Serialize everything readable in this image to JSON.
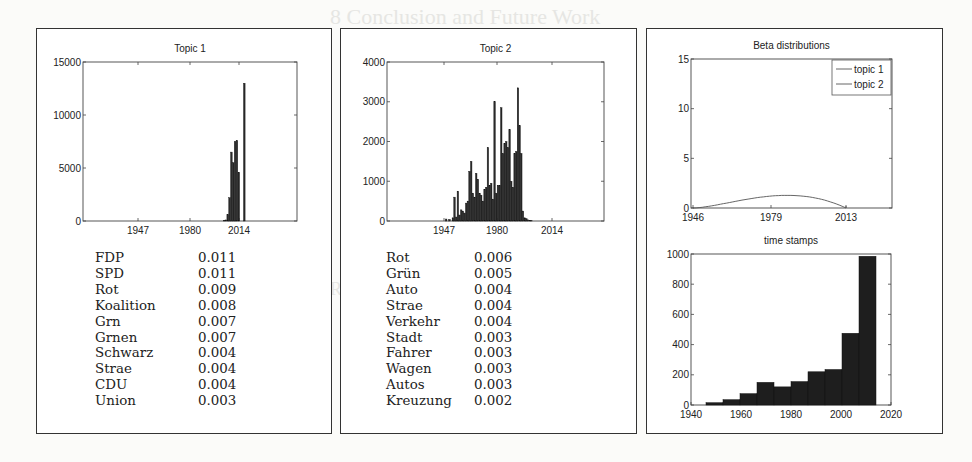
{
  "background_bleed": [
    "8   Conclusion and Future Work",
    "...",
    "References"
  ],
  "panels": [
    {
      "title": "Topic 1",
      "words": [
        {
          "word": "FDP",
          "prob": "0.011"
        },
        {
          "word": "SPD",
          "prob": "0.011"
        },
        {
          "word": "Rot",
          "prob": "0.009"
        },
        {
          "word": "Koalition",
          "prob": "0.008"
        },
        {
          "word": "Grn",
          "prob": "0.007"
        },
        {
          "word": "Grnen",
          "prob": "0.007"
        },
        {
          "word": "Schwarz",
          "prob": "0.004"
        },
        {
          "word": "Strae",
          "prob": "0.004"
        },
        {
          "word": "CDU",
          "prob": "0.004"
        },
        {
          "word": "Union",
          "prob": "0.003"
        }
      ]
    },
    {
      "title": "Topic 2",
      "words": [
        {
          "word": "Rot",
          "prob": "0.006"
        },
        {
          "word": "Grün",
          "prob": "0.005"
        },
        {
          "word": "Auto",
          "prob": "0.004"
        },
        {
          "word": "Strae",
          "prob": "0.004"
        },
        {
          "word": "Verkehr",
          "prob": "0.004"
        },
        {
          "word": "Stadt",
          "prob": "0.003"
        },
        {
          "word": "Fahrer",
          "prob": "0.003"
        },
        {
          "word": "Wagen",
          "prob": "0.003"
        },
        {
          "word": "Autos",
          "prob": "0.003"
        },
        {
          "word": "Kreuzung",
          "prob": "0.002"
        }
      ]
    }
  ],
  "chart_data": [
    {
      "type": "bar",
      "title": "Topic 1",
      "xlabel": "",
      "ylabel": "",
      "xticks": [
        "1947",
        "1980",
        "2014"
      ],
      "yticks": [
        0,
        5000,
        10000,
        15000
      ],
      "ylim": [
        0,
        15000
      ],
      "x": [
        2000,
        2001,
        2002,
        2003,
        2004,
        2005,
        2006,
        2007,
        2008,
        2009,
        2010,
        2011,
        2012
      ],
      "values": [
        50,
        100,
        600,
        2200,
        6500,
        5500,
        7500,
        7600,
        4600,
        0,
        0,
        13000,
        0
      ]
    },
    {
      "type": "bar",
      "title": "Topic 2",
      "xlabel": "",
      "ylabel": "",
      "xticks": [
        "1947",
        "1980",
        "2014"
      ],
      "yticks": [
        0,
        1000,
        2000,
        3000,
        4000
      ],
      "ylim": [
        0,
        4000
      ],
      "x": [
        1945,
        1947,
        1949,
        1950,
        1951,
        1952,
        1953,
        1954,
        1955,
        1956,
        1957,
        1958,
        1959,
        1960,
        1961,
        1962,
        1963,
        1964,
        1965,
        1966,
        1967,
        1968,
        1969,
        1970,
        1971,
        1972,
        1973,
        1974,
        1975,
        1976,
        1977,
        1978,
        1979,
        1980,
        1981,
        1982,
        1983,
        1984,
        1985,
        1986,
        1987,
        1988,
        1989,
        1990,
        1991,
        1992,
        1993,
        1994,
        1995,
        1996,
        1997,
        1998,
        1999,
        2000,
        2001,
        2002,
        2003,
        2004,
        2005
      ],
      "values": [
        50,
        40,
        80,
        600,
        100,
        750,
        150,
        280,
        250,
        200,
        450,
        500,
        1250,
        1500,
        700,
        600,
        1200,
        1050,
        700,
        650,
        500,
        800,
        850,
        1850,
        900,
        950,
        550,
        3000,
        700,
        900,
        900,
        2850,
        1700,
        1950,
        2000,
        1850,
        2300,
        1000,
        850,
        1700,
        1750,
        3350,
        2400,
        1700,
        250,
        80,
        60,
        30,
        20,
        10,
        0,
        0,
        0,
        0,
        0,
        0,
        0,
        0,
        0
      ]
    },
    {
      "type": "line",
      "title": "Beta distributions",
      "xlabel": "",
      "ylabel": "",
      "xticks": [
        "1946",
        "1979",
        "2013"
      ],
      "yticks": [
        0,
        5,
        10,
        15
      ],
      "ylim": [
        0,
        15
      ],
      "legend": [
        "topic 1",
        "topic 2"
      ],
      "legend_position": "upper right",
      "series": [
        {
          "name": "topic 1",
          "x": [
            1946,
            1955,
            1965,
            1975,
            1985,
            1993,
            2000,
            2005,
            2008,
            2010,
            2011,
            2012,
            2013
          ],
          "values": [
            0,
            0,
            0,
            0,
            0,
            0,
            0.1,
            0.8,
            3,
            8,
            14.3,
            12,
            0
          ]
        },
        {
          "name": "topic 2",
          "x": [
            1946,
            1955,
            1965,
            1975,
            1985,
            1993,
            2000,
            2005,
            2008,
            2010,
            2011,
            2012,
            2013
          ],
          "values": [
            0,
            0.3,
            0.9,
            1.4,
            1.7,
            1.8,
            1.6,
            1.2,
            0.8,
            0.5,
            0.3,
            0.1,
            0
          ]
        }
      ]
    },
    {
      "type": "bar",
      "title": "time stamps",
      "xlabel": "",
      "ylabel": "",
      "xticks": [
        "1940",
        "1960",
        "1980",
        "2000",
        "2020"
      ],
      "yticks": [
        0,
        200,
        400,
        600,
        800,
        1000
      ],
      "ylim": [
        0,
        1000
      ],
      "xlim": [
        1940,
        2020
      ],
      "bin_width": 6.8,
      "categories": [
        "1946",
        "1953",
        "1960",
        "1966",
        "1973",
        "1980",
        "1987",
        "1994",
        "2000",
        "2007"
      ],
      "values": [
        15,
        35,
        75,
        150,
        120,
        155,
        220,
        235,
        475,
        985
      ]
    }
  ]
}
